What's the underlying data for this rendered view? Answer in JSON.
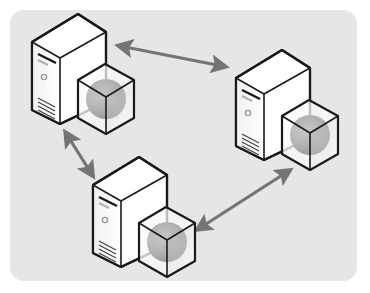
{
  "diagram": {
    "type": "network-topology",
    "nodes": [
      {
        "id": "server-1",
        "kind": "server-with-virtual-cube",
        "icon": "server-icon",
        "attachment": "cube-sphere-icon"
      },
      {
        "id": "server-2",
        "kind": "server-with-virtual-cube",
        "icon": "server-icon",
        "attachment": "cube-sphere-icon"
      },
      {
        "id": "server-3",
        "kind": "server-with-virtual-cube",
        "icon": "server-icon",
        "attachment": "cube-sphere-icon"
      }
    ],
    "edges": [
      {
        "from": "server-1",
        "to": "server-2",
        "direction": "bidirectional"
      },
      {
        "from": "server-1",
        "to": "server-3",
        "direction": "bidirectional"
      },
      {
        "from": "server-3",
        "to": "server-2",
        "direction": "bidirectional"
      }
    ],
    "colors": {
      "background": "#ffffff",
      "panel": "#e6e6e6",
      "arrow": "#747474",
      "outline": "#1a1a1a",
      "server_face": "#ffffff",
      "sphere": "#8a8a8a"
    }
  }
}
